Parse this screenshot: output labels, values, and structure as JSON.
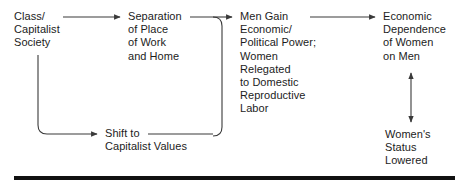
{
  "diagram": {
    "type": "flowchart",
    "title": "",
    "colors": {
      "text": "#1c1c1c",
      "connector": "#3a3a3a",
      "rule": "#111111",
      "background": "#ffffff"
    },
    "nodes": [
      {
        "id": "class-capitalist-society",
        "lines": [
          "Class/",
          "Capitalist",
          "Society"
        ]
      },
      {
        "id": "separation-place",
        "lines": [
          "Separation",
          "of Place",
          "of Work",
          "and Home"
        ]
      },
      {
        "id": "men-gain",
        "lines": [
          "Men Gain",
          "Economic/",
          "Political Power;",
          "Women",
          "Relegated",
          "to Domestic",
          "Reproductive",
          "Labor"
        ]
      },
      {
        "id": "economic-dependence",
        "lines": [
          "Economic",
          "Dependence",
          "of Women",
          "on Men"
        ]
      },
      {
        "id": "shift-capitalist-values",
        "lines": [
          "Shift to",
          "Capitalist Values"
        ]
      },
      {
        "id": "womens-status-lowered",
        "lines": [
          "Women's",
          "Status",
          "Lowered"
        ]
      }
    ],
    "connectors": [
      {
        "id": "class-to-separation",
        "from": "class-capitalist-society",
        "to": "separation-place",
        "style": "straight-horizontal",
        "heads": "end"
      },
      {
        "id": "class-to-shift",
        "from": "class-capitalist-society",
        "to": "shift-capitalist-values",
        "style": "down-then-right",
        "heads": "end"
      },
      {
        "id": "separation-to-men",
        "from": "separation-place",
        "to": "men-gain",
        "style": "right-then-down-join",
        "heads": "end"
      },
      {
        "id": "shift-to-men",
        "from": "shift-capitalist-values",
        "to": "men-gain",
        "style": "right-then-up-join",
        "heads": "end"
      },
      {
        "id": "men-to-dependence",
        "from": "men-gain",
        "to": "economic-dependence",
        "style": "straight-horizontal",
        "heads": "end"
      },
      {
        "id": "dependence-status",
        "from": "economic-dependence",
        "to": "womens-status-lowered",
        "style": "vertical",
        "heads": "both"
      }
    ],
    "rule": {
      "id": "bottom-rule",
      "present": true
    }
  }
}
